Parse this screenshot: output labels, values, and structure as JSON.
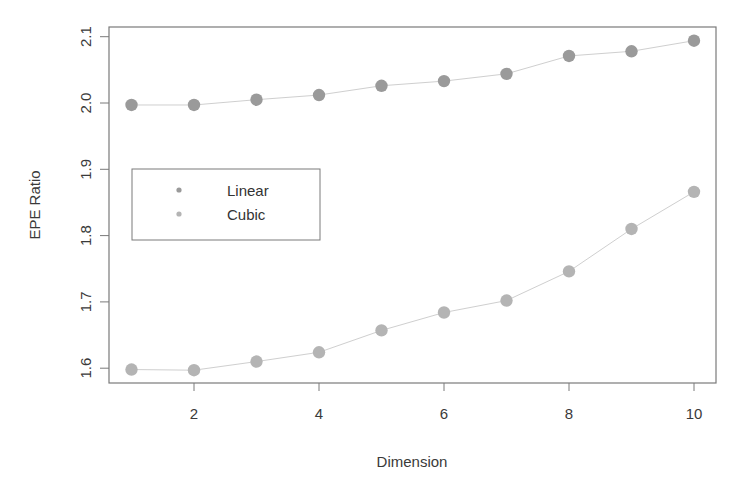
{
  "chart_data": {
    "type": "line",
    "title": "",
    "xlabel": "Dimension",
    "ylabel": "EPE Ratio",
    "x": [
      1,
      2,
      3,
      4,
      5,
      6,
      7,
      8,
      9,
      10
    ],
    "series": [
      {
        "name": "Linear",
        "color": "#9a9a9a",
        "values": [
          1.997,
          1.997,
          2.005,
          2.012,
          2.026,
          2.033,
          2.044,
          2.071,
          2.078,
          2.094
        ]
      },
      {
        "name": "Cubic",
        "color": "#b4b4b4",
        "values": [
          1.598,
          1.597,
          1.61,
          1.624,
          1.657,
          1.684,
          1.702,
          1.746,
          1.81,
          1.866
        ]
      }
    ],
    "xticks": [
      2,
      4,
      6,
      8,
      10
    ],
    "xtick_labels": [
      "2",
      "4",
      "6",
      "8",
      "10"
    ],
    "yticks": [
      1.6,
      1.7,
      1.8,
      1.9,
      2.0,
      2.1
    ],
    "ytick_labels": [
      "1.6",
      "1.7",
      "1.8",
      "1.9",
      "2.0",
      "2.1"
    ],
    "xlim": [
      0.64,
      10.36
    ],
    "ylim": [
      1.583,
      2.115
    ],
    "grid": false,
    "legend": {
      "position": "left-middle",
      "entries": [
        "Linear",
        "Cubic"
      ]
    }
  },
  "colors": {
    "axis": "#7a7a7a",
    "line": "#cfcfcf",
    "text": "#3a3a3a"
  }
}
